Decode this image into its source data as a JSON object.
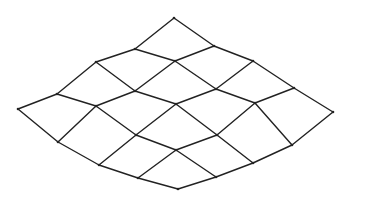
{
  "diagram": {
    "type": "quad-mesh-perspective",
    "rows": 5,
    "cols": 5,
    "stroke_color": "#222222",
    "background": "#ffffff",
    "vertices": [
      [
        [
          174,
          18
        ],
        [
          214,
          46
        ],
        [
          253,
          61
        ],
        [
          294,
          88
        ],
        [
          333,
          112
        ]
      ],
      [
        [
          135,
          49
        ],
        [
          175,
          61
        ],
        [
          216,
          89
        ],
        [
          255,
          103
        ],
        [
          292,
          145
        ]
      ],
      [
        [
          96,
          62
        ],
        [
          135,
          91
        ],
        [
          176,
          104
        ],
        [
          217,
          135
        ],
        [
          253,
          163
        ]
      ],
      [
        [
          57,
          94
        ],
        [
          96,
          106
        ],
        [
          136,
          135
        ],
        [
          176,
          150
        ],
        [
          216,
          177
        ]
      ],
      [
        [
          18,
          109
        ],
        [
          58,
          142
        ],
        [
          99,
          165
        ],
        [
          138,
          178
        ],
        [
          178,
          189
        ]
      ]
    ]
  }
}
